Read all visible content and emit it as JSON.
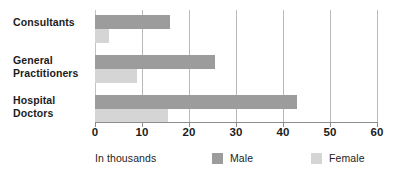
{
  "chart_data": {
    "type": "bar",
    "orientation": "horizontal",
    "title": "",
    "subtitle": "",
    "xlabel": "In thousands",
    "ylabel": "",
    "categories": [
      "Consultants",
      "General Practitioners",
      "Hospital Doctors"
    ],
    "series": [
      {
        "name": "Male",
        "color": "#9c9c9c",
        "values": [
          16,
          25.5,
          43
        ]
      },
      {
        "name": "Female",
        "color": "#d5d5d5",
        "values": [
          3,
          9,
          15.5
        ]
      }
    ],
    "xlim": [
      0,
      60
    ],
    "xticks": [
      0,
      10,
      20,
      30,
      40,
      50,
      60
    ],
    "xtick_labels": [
      "0",
      "10",
      "20",
      "30",
      "40",
      "50",
      "60"
    ],
    "grid": "vertical",
    "legend_position": "bottom-right",
    "legend_entries": [
      "Male",
      "Female"
    ]
  },
  "category_labels": [
    {
      "line1": "Consultants",
      "line2": ""
    },
    {
      "line1": "General",
      "line2": "Practitioners"
    },
    {
      "line1": "Hospital",
      "line2": "Doctors"
    }
  ],
  "footer": {
    "axis_title": "In thousands",
    "legend": [
      {
        "label": "Male",
        "swatch": "male-swatch"
      },
      {
        "label": "Female",
        "swatch": "female-swatch"
      }
    ]
  }
}
